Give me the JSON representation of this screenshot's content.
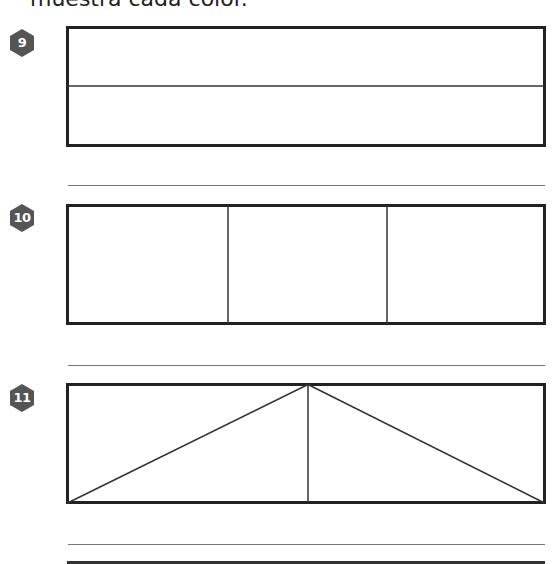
{
  "heading": "muestra cada color.",
  "problems": [
    {
      "number": "9",
      "figure": "rectangle divided horizontally into 2 equal parts"
    },
    {
      "number": "10",
      "figure": "rectangle divided vertically into 3 equal parts"
    },
    {
      "number": "11",
      "figure": "rectangle divided into 4 triangles by a vertical center line and diagonals from top-center to bottom corners"
    }
  ],
  "colors": {
    "badge": "#555555",
    "stroke": "#222222",
    "answer_line": "#777777"
  }
}
